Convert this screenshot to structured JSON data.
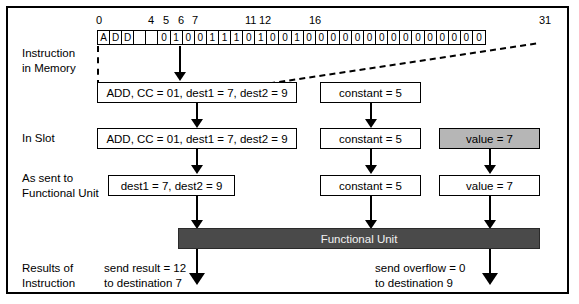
{
  "ruler": {
    "ticks": [
      {
        "label": "0",
        "bit": 0
      },
      {
        "label": "4",
        "bit": 4
      },
      {
        "label": "5",
        "bit": 5
      },
      {
        "label": "6",
        "bit": 6
      },
      {
        "label": "7",
        "bit": 7
      },
      {
        "label": "11",
        "bit": 11
      },
      {
        "label": "12",
        "bit": 12
      },
      {
        "label": "16",
        "bit": 16
      },
      {
        "label": "31",
        "bit": 31
      }
    ]
  },
  "instruction_word": {
    "opcode_cells": [
      "A",
      "D",
      "D",
      "",
      ""
    ],
    "bits": [
      "0",
      "1",
      "0",
      "0",
      "1",
      "1",
      "1",
      "0",
      "1",
      "0",
      "0",
      "1",
      "0",
      "0",
      "0",
      "0",
      "0",
      "0",
      "0",
      "0",
      "0",
      "0",
      "0",
      "0",
      "0",
      "0",
      "0"
    ],
    "all_cells": [
      "A",
      "D",
      "D",
      "",
      "",
      "0",
      "1",
      "0",
      "0",
      "1",
      "1",
      "1",
      "0",
      "1",
      "0",
      "0",
      "1",
      "0",
      "0",
      "0",
      "0",
      "0",
      "0",
      "0",
      "0",
      "0",
      "0",
      "0",
      "0",
      "0",
      "0",
      "0"
    ]
  },
  "rows": {
    "instruction_in_memory": {
      "line1": "Instruction",
      "line2": "in Memory"
    },
    "in_slot": {
      "line1": "In Slot",
      "line2": ""
    },
    "as_sent": {
      "line1": "As sent to",
      "line2": "Functional Unit"
    },
    "results": {
      "line1": "Results of",
      "line2": "Instruction"
    }
  },
  "decoded": {
    "opcode_box": "ADD, CC = 01, dest1 = 7, dest2 = 9",
    "constant_box": "constant = 5"
  },
  "in_slot": {
    "opcode_box": "ADD, CC = 01, dest1 = 7, dest2 = 9",
    "constant_box": "constant = 5",
    "value_box": "value = 7"
  },
  "as_sent": {
    "dest_box": "dest1 = 7, dest2 = 9",
    "constant_box": "constant = 5",
    "value_box": "value = 7"
  },
  "functional_unit": {
    "label": "Functional Unit"
  },
  "results": {
    "result": {
      "line1": "send result = 12",
      "line2": "to destination 7"
    },
    "overflow": {
      "line1": "send overflow = 0",
      "line2": "to destination 9"
    }
  },
  "colors": {
    "shaded_box": "#b6b6b6",
    "functional_unit": "#4a4a4a",
    "functional_unit_text": "#f2f2f2",
    "line": "#000000",
    "background": "#ffffff"
  }
}
